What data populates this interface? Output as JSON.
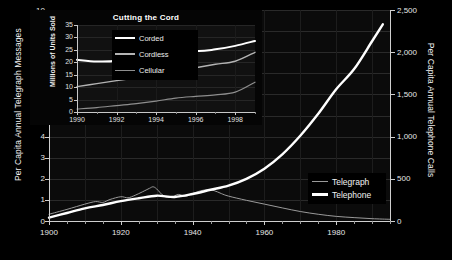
{
  "chart_data": [
    {
      "type": "line",
      "title": "",
      "xlabel": "",
      "ylabel": "Per Capita Annual Telegraph Messages",
      "y2label": "Per Capita Annual Telephone Calls",
      "xlim": [
        1900,
        1995
      ],
      "ylim": [
        0,
        10
      ],
      "y2lim": [
        0,
        2500
      ],
      "grid": true,
      "legend_position": "bottom-right",
      "xticks": [
        1900,
        1920,
        1940,
        1960,
        1980
      ],
      "xticklabels": [
        "1900",
        "1920",
        "1940",
        "1960",
        "1980"
      ],
      "xminortick_step": 5,
      "yticks": [
        0,
        1,
        2,
        3,
        4,
        5,
        6,
        7,
        8,
        9,
        10
      ],
      "yticklabels": [
        "0",
        "1",
        "2",
        "3",
        "4",
        "5",
        "6",
        "7",
        "8",
        "9",
        "10"
      ],
      "y2ticks": [
        0,
        500,
        1000,
        1500,
        2000,
        2500
      ],
      "y2ticklabels": [
        "0",
        "500",
        "1,000",
        "1,500",
        "2,000",
        "2,500"
      ],
      "series": [
        {
          "name": "Telegraph",
          "axis": "left",
          "color": "#9a9a9a",
          "linewidth": 1,
          "x": [
            1900,
            1905,
            1910,
            1913,
            1915,
            1917,
            1920,
            1922,
            1924,
            1926,
            1928,
            1929,
            1930,
            1932,
            1934,
            1936,
            1938,
            1940,
            1942,
            1944,
            1946,
            1948,
            1950,
            1955,
            1960,
            1965,
            1970,
            1975,
            1980,
            1985,
            1990,
            1995
          ],
          "y": [
            0.32,
            0.55,
            0.8,
            0.92,
            0.88,
            1.02,
            1.15,
            1.1,
            1.22,
            1.38,
            1.55,
            1.62,
            1.52,
            1.18,
            1.12,
            1.26,
            1.17,
            1.3,
            1.42,
            1.48,
            1.44,
            1.3,
            1.18,
            0.98,
            0.8,
            0.62,
            0.45,
            0.32,
            0.22,
            0.16,
            0.11,
            0.08
          ]
        },
        {
          "name": "Telephone",
          "axis": "right",
          "color": "#ffffff",
          "linewidth": 2.4,
          "x": [
            1900,
            1905,
            1910,
            1915,
            1920,
            1925,
            1930,
            1935,
            1940,
            1945,
            1950,
            1955,
            1960,
            1965,
            1970,
            1975,
            1980,
            1985,
            1990,
            1993
          ],
          "y": [
            40,
            95,
            150,
            190,
            235,
            270,
            300,
            285,
            320,
            370,
            420,
            500,
            620,
            790,
            1010,
            1270,
            1560,
            1800,
            2130,
            2330
          ]
        }
      ]
    },
    {
      "type": "line",
      "title": "Cutting the Cord",
      "xlabel": "",
      "ylabel": "Millions of Units Sold",
      "xlim": [
        1990,
        1999
      ],
      "ylim": [
        0,
        35
      ],
      "grid": true,
      "legend_position": "upper-center",
      "xticks": [
        1990,
        1992,
        1994,
        1996,
        1998
      ],
      "xticklabels": [
        "1990",
        "1992",
        "1994",
        "1996",
        "1998"
      ],
      "yticks": [
        0,
        5,
        10,
        15,
        20,
        25,
        30,
        35
      ],
      "yticklabels": [
        "0",
        "5",
        "10",
        "15",
        "20",
        "25",
        "30",
        "35"
      ],
      "series": [
        {
          "name": "Corded",
          "color": "#ffffff",
          "linewidth": 2,
          "x": [
            1990,
            1991,
            1992,
            1993,
            1994,
            1995,
            1996,
            1997,
            1998,
            1999
          ],
          "y": [
            21.0,
            20.3,
            20.6,
            22.6,
            25.8,
            26.8,
            24.6,
            25.2,
            26.6,
            28.6
          ]
        },
        {
          "name": "Cordless",
          "color": "#b4b4b4",
          "linewidth": 1.4,
          "x": [
            1990,
            1991,
            1992,
            1993,
            1994,
            1995,
            1996,
            1997,
            1998,
            1999
          ],
          "y": [
            10.2,
            11.4,
            12.6,
            13.8,
            15.1,
            16.2,
            17.8,
            19.2,
            20.4,
            24.0
          ]
        },
        {
          "name": "Cellular",
          "color": "#8e8e8e",
          "linewidth": 1.2,
          "x": [
            1990,
            1991,
            1992,
            1993,
            1994,
            1995,
            1996,
            1997,
            1998,
            1999
          ],
          "y": [
            1.2,
            1.8,
            2.6,
            3.4,
            4.4,
            5.6,
            6.3,
            6.9,
            8.0,
            12.0
          ]
        }
      ]
    }
  ],
  "main": {
    "y_left_title": "Per Capita Annual Telegraph Messages",
    "y_right_title": "Per Capita Annual Telephone Calls",
    "legend": {
      "telegraph_label": "Telegraph",
      "telephone_label": "Telephone"
    }
  },
  "inset": {
    "title": "Cutting the Cord",
    "y_title": "Millions of Units Sold",
    "legend": {
      "corded_label": "Corded",
      "cordless_label": "Cordless",
      "cellular_label": "Cellular"
    }
  },
  "colors": {
    "background": "#000000",
    "plot_background": "#0b0b0b",
    "telegraph": "#9a9a9a",
    "telephone": "#ffffff",
    "corded": "#ffffff",
    "cordless": "#b4b4b4",
    "cellular": "#8e8e8e",
    "axis": "#cfcfcf",
    "grid": "#2a2a2a"
  }
}
